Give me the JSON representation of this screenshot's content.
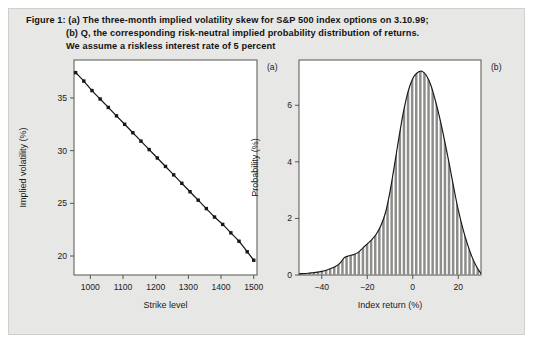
{
  "caption": {
    "line1": "Figure 1: (a) The three-month implied volatility skew for S&P 500 index options on 3.10.99;",
    "line2": "(b) Q, the corresponding risk-neutral implied probability distribution of returns.",
    "line3": "We assume a riskless interest rate of 5 percent"
  },
  "panel_tags": {
    "a": "(a)",
    "b": "(b)"
  },
  "chart_data": [
    {
      "type": "line",
      "id": "implied-volatility-skew",
      "title": "",
      "xlabel": "Strike level",
      "ylabel": "Implied volatility (%)",
      "xlim": [
        950,
        1510
      ],
      "ylim": [
        18.2,
        38.6
      ],
      "xticks": [
        1000,
        1100,
        1200,
        1300,
        1400,
        1500
      ],
      "xticklabels": [
        "1000",
        "1100",
        "1200",
        "1300",
        "1400",
        "1500"
      ],
      "yticks": [
        20,
        25,
        30,
        35
      ],
      "yticklabels": [
        "20",
        "25",
        "30",
        "35"
      ],
      "grid": false,
      "legend": "none",
      "marker": "square",
      "x": [
        955,
        980,
        1005,
        1030,
        1055,
        1080,
        1105,
        1130,
        1155,
        1180,
        1205,
        1230,
        1255,
        1280,
        1305,
        1330,
        1355,
        1380,
        1405,
        1430,
        1455,
        1480,
        1500
      ],
      "values": [
        37.4,
        36.6,
        35.7,
        34.9,
        34.1,
        33.3,
        32.5,
        31.7,
        30.9,
        30.1,
        29.3,
        28.5,
        27.7,
        26.9,
        26.1,
        25.3,
        24.5,
        23.7,
        23.0,
        22.2,
        21.4,
        20.4,
        19.6
      ]
    },
    {
      "type": "area",
      "id": "risk-neutral-probability-distribution",
      "title": "",
      "xlabel": "Index return (%)",
      "ylabel": "Probability (%)",
      "xlim": [
        -50,
        30
      ],
      "ylim": [
        0,
        7.6
      ],
      "xticks": [
        -40,
        -20,
        0,
        20
      ],
      "xticklabels": [
        "−40",
        "−20",
        "0",
        "20"
      ],
      "yticks": [
        0,
        2,
        4,
        6
      ],
      "yticklabels": [
        "0",
        "2",
        "4",
        "6"
      ],
      "grid": false,
      "legend": "none",
      "fill": "vertical-hatch",
      "x": [
        -50,
        -48,
        -46,
        -44,
        -42,
        -40,
        -38,
        -36,
        -34,
        -32,
        -30,
        -28,
        -26,
        -24,
        -22,
        -20,
        -18,
        -16,
        -14,
        -12,
        -10,
        -8,
        -6,
        -4,
        -2,
        0,
        2,
        4,
        6,
        8,
        10,
        12,
        14,
        16,
        18,
        20,
        22,
        24,
        26,
        28,
        30
      ],
      "values": [
        0.04,
        0.05,
        0.06,
        0.08,
        0.1,
        0.13,
        0.17,
        0.23,
        0.3,
        0.42,
        0.62,
        0.68,
        0.72,
        0.8,
        0.95,
        1.1,
        1.25,
        1.45,
        1.75,
        2.2,
        2.95,
        3.9,
        4.9,
        5.8,
        6.5,
        6.95,
        7.15,
        7.2,
        7.05,
        6.7,
        6.15,
        5.5,
        4.75,
        3.95,
        3.1,
        2.3,
        1.65,
        1.1,
        0.65,
        0.3,
        0.05
      ]
    }
  ]
}
